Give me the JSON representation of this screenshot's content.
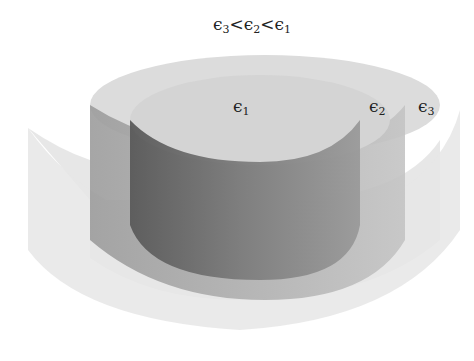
{
  "title": {
    "eps": "ϵ",
    "s1": "3",
    "lt1": "<",
    "s2": "2",
    "lt2": "<",
    "s3": "1"
  },
  "labels": [
    {
      "sym": "ϵ",
      "sub": "1"
    },
    {
      "sym": "ϵ",
      "sub": "2"
    },
    {
      "sym": "ϵ",
      "sub": "3"
    }
  ],
  "colors": {
    "inner": "#8a8a8a",
    "middle": "#b8b8b8",
    "outer": "#e2e2e2",
    "top": "#d8d8d8"
  }
}
